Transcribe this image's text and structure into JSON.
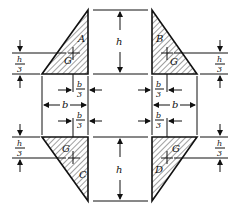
{
  "diagram": {
    "triangles": [
      {
        "label": "A",
        "centroid_label": "G",
        "position": "top-left"
      },
      {
        "label": "B",
        "centroid_label": "G",
        "position": "top-right"
      },
      {
        "label": "C",
        "centroid_label": "G",
        "position": "bottom-left"
      },
      {
        "label": "D",
        "centroid_label": "G",
        "position": "bottom-right"
      }
    ],
    "dimensions": {
      "height": "h",
      "base": "b",
      "height_third_num": "h",
      "height_third_den": "3",
      "base_third_num": "b",
      "base_third_den": "3"
    },
    "colors": {
      "stroke": "#111111",
      "background": "#ffffff"
    }
  }
}
